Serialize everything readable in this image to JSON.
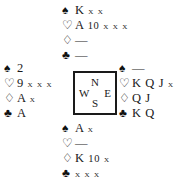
{
  "diagram": {
    "type": "bridge-deal",
    "suit_symbols": {
      "spade": "♠",
      "heart": "♡",
      "diamond": "♢",
      "club": "♣"
    },
    "void_marker": "—",
    "compass": {
      "north": "N",
      "west": "W",
      "east": "E",
      "south": "S"
    },
    "hands": {
      "north": {
        "label": "North",
        "spades": "K x x",
        "hearts": "A 10 x x x",
        "diamonds": "—",
        "clubs": "—"
      },
      "west": {
        "label": "West",
        "spades": "2",
        "hearts": "9 x x x",
        "diamonds": "A x",
        "clubs": "A"
      },
      "east": {
        "label": "East",
        "spades": "—",
        "hearts": "K Q J x",
        "diamonds": "Q J",
        "clubs": "K Q"
      },
      "south": {
        "label": "South",
        "spades": "A x",
        "hearts": "—",
        "diamonds": "K 10 x",
        "clubs": "x x x"
      }
    }
  }
}
